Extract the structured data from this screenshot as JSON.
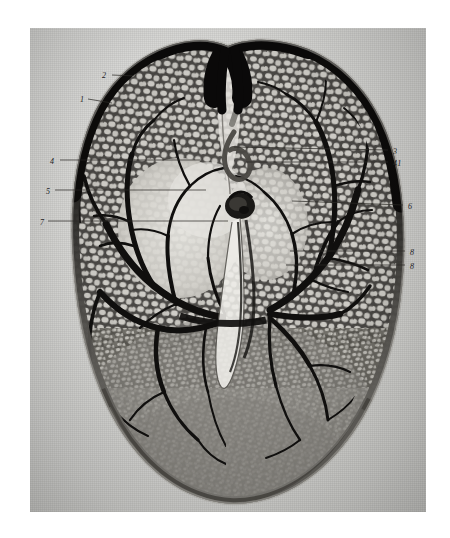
{
  "figure": {
    "kind": "halftone-photographic-plate",
    "medium": "black and white monochrome photograph on aged paper",
    "page_background": "#ffffff",
    "plate_background": "#d5d5d3",
    "ink_dark": "#141210",
    "label_color": "#23211e",
    "leader_color": "#2b2926"
  },
  "labels": [
    {
      "id": "label-2",
      "text": "2",
      "x": 102,
      "y": 72,
      "side": "left"
    },
    {
      "id": "label-1",
      "text": "1",
      "x": 80,
      "y": 96,
      "side": "left"
    },
    {
      "id": "label-4-sub",
      "text": "4",
      "x": 50,
      "y": 158,
      "side": "left"
    },
    {
      "id": "label-5",
      "text": "5",
      "x": 46,
      "y": 188,
      "side": "left"
    },
    {
      "id": "label-7",
      "text": "7",
      "x": 40,
      "y": 219,
      "side": "left"
    },
    {
      "id": "label-3",
      "text": "3",
      "x": 393,
      "y": 148,
      "side": "right"
    },
    {
      "id": "label-41",
      "text": "41",
      "x": 393,
      "y": 160,
      "side": "right"
    },
    {
      "id": "label-6",
      "text": "6",
      "x": 408,
      "y": 203,
      "side": "right"
    },
    {
      "id": "label-8-upper",
      "text": "8",
      "x": 410,
      "y": 249,
      "side": "right"
    },
    {
      "id": "label-8-lower",
      "text": "8",
      "x": 410,
      "y": 263,
      "side": "right"
    }
  ],
  "leaders": [
    {
      "id": "leader-2",
      "from_label": "2",
      "x1": 112,
      "y1": 75,
      "x2": 136,
      "y2": 76
    },
    {
      "id": "leader-1",
      "from_label": "1",
      "x1": 88,
      "y1": 99,
      "x2": 112,
      "y2": 103
    },
    {
      "id": "leader-4-sub",
      "from_label": "4",
      "x1": 60,
      "y1": 160,
      "x2": 200,
      "y2": 160
    },
    {
      "id": "leader-5",
      "from_label": "5",
      "x1": 55,
      "y1": 190,
      "x2": 206,
      "y2": 190
    },
    {
      "id": "leader-7",
      "from_label": "7",
      "x1": 48,
      "y1": 221,
      "x2": 228,
      "y2": 221
    },
    {
      "id": "leader-3",
      "from_label": "3",
      "x1": 388,
      "y1": 150,
      "x2": 234,
      "y2": 147
    },
    {
      "id": "leader-41",
      "from_label": "41",
      "x1": 388,
      "y1": 162,
      "x2": 246,
      "y2": 162
    },
    {
      "id": "leader-6",
      "from_label": "6",
      "x1": 403,
      "y1": 205,
      "x2": 292,
      "y2": 201
    },
    {
      "id": "leader-8-upper",
      "from_label": "8",
      "x1": 405,
      "y1": 251,
      "x2": 290,
      "y2": 251
    },
    {
      "id": "leader-8-lower",
      "from_label": "8",
      "x1": 405,
      "y1": 265,
      "x2": 286,
      "y2": 265
    }
  ],
  "plate_geometry": {
    "left": 30,
    "top": 28,
    "width": 396,
    "height": 484
  }
}
